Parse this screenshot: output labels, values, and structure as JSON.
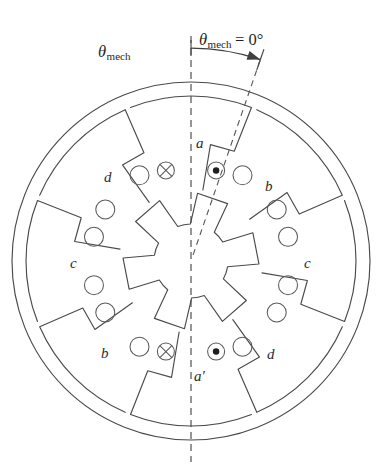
{
  "figure": {
    "type": "cross-section-diagram",
    "stator_poles": 8,
    "rotor_teeth": 6,
    "background": "#ffffff",
    "ink_color": "#4a4a4a"
  },
  "annotations": {
    "reference_axis_label": {
      "theta": "θ",
      "sub": "mech",
      "equals": " = 0°"
    },
    "angle_label": {
      "theta": "θ",
      "sub": "mech"
    }
  },
  "geometry": {
    "center_x": 191,
    "center_y": 261,
    "outer_radius": 179,
    "yoke_inner_radius": 165,
    "stator_pole_tip_radius": 72,
    "rotor_tip_radius": 68,
    "rotor_hub_radius": 37,
    "rotor_offset_deg": -19,
    "reference_axis_x": 191,
    "reference_axis_top_y": 36,
    "reference_axis_bottom_y": 462
  },
  "stator_pole_labels": [
    {
      "id": "pole-a",
      "text": "a",
      "x": 196,
      "y": 136,
      "angle_deg": 90
    },
    {
      "id": "pole-b-upper-right",
      "text": "b",
      "x": 265,
      "y": 179,
      "angle_deg": 45
    },
    {
      "id": "pole-c-right",
      "text": "c",
      "x": 304,
      "y": 256,
      "angle_deg": 0
    },
    {
      "id": "pole-d-lower-right",
      "text": "d",
      "x": 267,
      "y": 347,
      "angle_deg": -45
    },
    {
      "id": "pole-a-prime",
      "text": "a′",
      "x": 194,
      "y": 369,
      "angle_deg": -90
    },
    {
      "id": "pole-b-lower-left",
      "text": "b",
      "x": 101,
      "y": 346,
      "angle_deg": -135
    },
    {
      "id": "pole-c-left",
      "text": "c",
      "x": 70,
      "y": 256,
      "angle_deg": 180
    },
    {
      "id": "pole-d-upper-left",
      "text": "d",
      "x": 104,
      "y": 170,
      "angle_deg": 135
    }
  ],
  "conductors": {
    "into_page_symbol": "⊗",
    "out_of_page_symbol": "⊙",
    "marked_poles": [
      "a",
      "a′"
    ],
    "plain_circle_radius": 9.5,
    "symbol_radius": 8.5
  }
}
